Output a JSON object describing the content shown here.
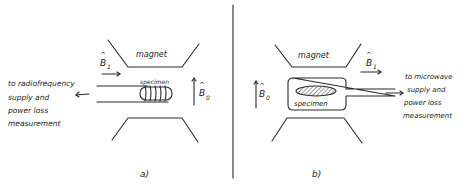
{
  "panels": {
    "a": {
      "label": "a)",
      "magnet_label": "magnet",
      "specimen_label": "specimen",
      "b1_label": "B",
      "b1_sub": "1",
      "b0_label": "B",
      "b0_sub": "0",
      "connection_text": [
        "to radiofrequency",
        "supply and",
        "power loss",
        "measurement"
      ]
    },
    "b": {
      "label": "b)",
      "magnet_label": "magnet",
      "specimen_label": "specimen",
      "b1_label": "B",
      "b1_sub": "1",
      "b0_label": "B",
      "b0_sub": "0",
      "connection_text": [
        "to microwave",
        "supply and",
        "power loss",
        "measurement"
      ]
    }
  },
  "colors": {
    "ink": "#2a2a2a",
    "background": "#ffffff"
  }
}
